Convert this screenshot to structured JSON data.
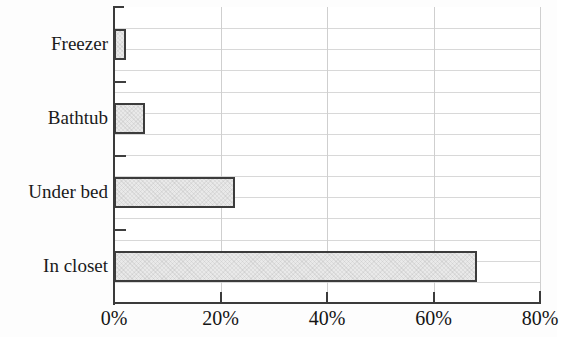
{
  "chart_data": {
    "type": "bar",
    "orientation": "horizontal",
    "title": "",
    "subtitle": "",
    "xlabel": "",
    "ylabel": "",
    "categories": [
      "Freezer",
      "Bathtub",
      "Under bed",
      "In closet"
    ],
    "values": [
      2.3,
      5.8,
      22.7,
      68.2
    ],
    "value_display": [
      "2.3%",
      "5.8%",
      "22.7%",
      "68.2%"
    ],
    "xlim": [
      0,
      80
    ],
    "ylim": null,
    "xticks": [
      0,
      20,
      40,
      60,
      80
    ],
    "xtick_labels": [
      "0%",
      "20%",
      "40%",
      "60%",
      "80%"
    ],
    "grid": true,
    "grid_axis": "both",
    "legend": null,
    "legend_position": "none",
    "annotations": [],
    "series": [
      {
        "name": "",
        "values": [
          2.3,
          5.8,
          22.7,
          68.2
        ]
      }
    ],
    "colors": {
      "bar_fill": "#e9e9e9",
      "bar_border": "#3c3c3c",
      "axis": "#3b3b3b",
      "gridline": "#d8d8d8",
      "vertical_gridline": "#cfcfcf",
      "text": "#1a1a1a",
      "background": "#ffffff"
    }
  },
  "axes": {
    "x_tick_labels": [
      "0%",
      "20%",
      "40%",
      "60%",
      "80%"
    ],
    "y_tick_labels": [
      "Freezer",
      "Bathtub",
      "Under bed",
      "In closet"
    ]
  },
  "horizontal_gridline_count": 13
}
